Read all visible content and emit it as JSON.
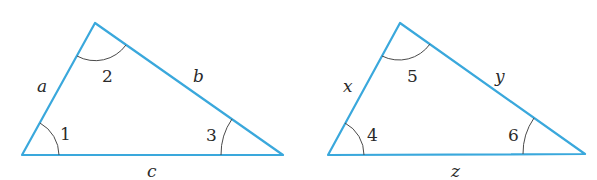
{
  "diagram": {
    "line_color": "#3aa8dc",
    "triangles": [
      {
        "name": "triangle-abc",
        "vertices": {
          "bottom_left": [
            22,
            155
          ],
          "top": [
            95,
            23
          ],
          "bottom_right": [
            283,
            155
          ]
        },
        "sides": {
          "left": "a",
          "right": "b",
          "bottom": "c"
        },
        "angles": {
          "bottom_left": "1",
          "top": "2",
          "bottom_right": "3"
        }
      },
      {
        "name": "triangle-xyz",
        "vertices": {
          "bottom_left": [
            328,
            155
          ],
          "top": [
            400,
            23
          ],
          "bottom_right": [
            585,
            154
          ]
        },
        "sides": {
          "left": "x",
          "right": "y",
          "bottom": "z"
        },
        "angles": {
          "bottom_left": "4",
          "top": "5",
          "bottom_right": "6"
        }
      }
    ]
  }
}
